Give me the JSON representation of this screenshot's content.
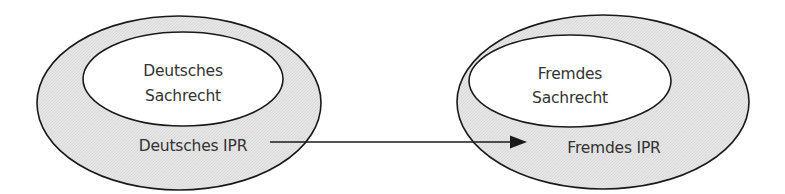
{
  "diagram": {
    "left_system": {
      "outer_label": "Deutsches IPR",
      "inner_label_line1": "Deutsches",
      "inner_label_line2": "Sachrecht"
    },
    "right_system": {
      "outer_label": "Fremdes IPR",
      "inner_label_line1": "Fremdes",
      "inner_label_line2": "Sachrecht"
    },
    "arrow": {
      "from": "Deutsches IPR",
      "to": "Fremdes IPR"
    },
    "colors": {
      "outer_fill": "#e4e4e4",
      "inner_fill": "#ffffff",
      "stroke": "#1a1a1a",
      "text": "#333333"
    }
  }
}
